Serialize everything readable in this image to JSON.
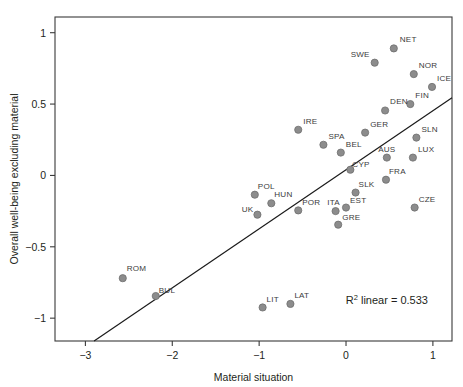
{
  "chart_data": {
    "type": "scatter",
    "title": "",
    "xlabel": "Material situation",
    "ylabel": "Overall well-being excluding material",
    "xlim": [
      -3.35,
      1.22
    ],
    "ylim": [
      -1.16,
      1.11
    ],
    "xticks": [
      -3,
      -2,
      -1,
      0,
      1
    ],
    "xticklabels": [
      "−3",
      "−2",
      "−1",
      "0",
      "1"
    ],
    "yticks": [
      1,
      0.5,
      0,
      -0.5,
      -1
    ],
    "yticklabels": [
      "1",
      "0.5",
      "0",
      "−0.5",
      "−1"
    ],
    "grid": false,
    "legend": null,
    "annotation": {
      "text_prefix": "R",
      "text_sup": "2",
      "text_suffix": " linear = 0.533",
      "r_squared": 0.533,
      "x": 0.47,
      "y": -0.9
    },
    "fit_line": {
      "type": "linear",
      "x_start": -2.9,
      "y_start": -1.16,
      "x_end": 1.22,
      "y_end": 0.545
    },
    "marker": {
      "color": "#8c8c8c",
      "edge_color": "#6e6e6e",
      "radius_px": 3.6
    },
    "points": [
      {
        "label": "NET",
        "x": 0.55,
        "y": 0.89,
        "lx": 6,
        "ly": -6
      },
      {
        "label": "SWE",
        "x": 0.33,
        "y": 0.79,
        "lx": -5,
        "ly": -6,
        "anchor": "end"
      },
      {
        "label": "NOR",
        "x": 0.78,
        "y": 0.71,
        "lx": 5,
        "ly": -6
      },
      {
        "label": "ICE",
        "x": 0.99,
        "y": 0.62,
        "lx": 5,
        "ly": -6
      },
      {
        "label": "FIN",
        "x": 0.74,
        "y": 0.5,
        "lx": 5,
        "ly": -6
      },
      {
        "label": "DEN",
        "x": 0.45,
        "y": 0.455,
        "lx": 5,
        "ly": -6
      },
      {
        "label": "IRE",
        "x": -0.55,
        "y": 0.32,
        "lx": 5,
        "ly": -6
      },
      {
        "label": "GER",
        "x": 0.22,
        "y": 0.3,
        "lx": 5,
        "ly": -6
      },
      {
        "label": "SLN",
        "x": 0.81,
        "y": 0.265,
        "lx": 5,
        "ly": -6
      },
      {
        "label": "SPA",
        "x": -0.26,
        "y": 0.215,
        "lx": 5,
        "ly": -6
      },
      {
        "label": "BEL",
        "x": -0.06,
        "y": 0.16,
        "lx": 5,
        "ly": -6
      },
      {
        "label": "AUS",
        "x": 0.47,
        "y": 0.125,
        "lx": 0,
        "ly": -6,
        "anchor": "middle"
      },
      {
        "label": "LUX",
        "x": 0.77,
        "y": 0.125,
        "lx": 5,
        "ly": -6
      },
      {
        "label": "CYP",
        "x": 0.05,
        "y": 0.04,
        "lx": 2,
        "ly": -3
      },
      {
        "label": "FRA",
        "x": 0.46,
        "y": -0.03,
        "lx": 3,
        "ly": -6
      },
      {
        "label": "SLK",
        "x": 0.11,
        "y": -0.12,
        "lx": 3,
        "ly": -6
      },
      {
        "label": "POL",
        "x": -1.05,
        "y": -0.135,
        "lx": 3,
        "ly": -6
      },
      {
        "label": "HUN",
        "x": -0.86,
        "y": -0.195,
        "lx": 3,
        "ly": -6
      },
      {
        "label": "EST",
        "x": 0.0,
        "y": -0.225,
        "lx": 4,
        "ly": -5
      },
      {
        "label": "CZE",
        "x": 0.79,
        "y": -0.225,
        "lx": 4,
        "ly": -6
      },
      {
        "label": "POR",
        "x": -0.55,
        "y": -0.245,
        "lx": 4,
        "ly": -5
      },
      {
        "label": "ITA",
        "x": -0.12,
        "y": -0.25,
        "lx": -2,
        "ly": -6,
        "anchor": "middle"
      },
      {
        "label": "UK",
        "x": -1.02,
        "y": -0.275,
        "lx": -4,
        "ly": -3,
        "anchor": "end"
      },
      {
        "label": "GRE",
        "x": -0.09,
        "y": -0.345,
        "lx": 4,
        "ly": -5
      },
      {
        "label": "ROM",
        "x": -2.57,
        "y": -0.72,
        "lx": 4,
        "ly": -7
      },
      {
        "label": "BUL",
        "x": -2.19,
        "y": -0.845,
        "lx": 3,
        "ly": -3
      },
      {
        "label": "LAT",
        "x": -0.64,
        "y": -0.9,
        "lx": 4,
        "ly": -6
      },
      {
        "label": "LIT",
        "x": -0.96,
        "y": -0.925,
        "lx": 4,
        "ly": -5
      }
    ]
  }
}
